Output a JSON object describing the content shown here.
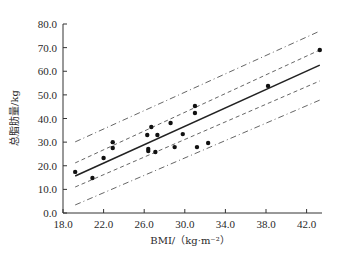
{
  "chart_data": {
    "type": "scatter",
    "title": "",
    "xlabel": "BMI/（kg·m⁻²）",
    "ylabel": "总脂肪量/kg",
    "xlim": [
      18.0,
      44.0
    ],
    "ylim": [
      0.0,
      80.0
    ],
    "x_ticks": [
      "18.0",
      "22.0",
      "26.0",
      "30.0",
      "34.0",
      "38.0",
      "42.0"
    ],
    "y_ticks": [
      "0.0",
      "10.0",
      "20.0",
      "30.0",
      "40.0",
      "50.0",
      "60.0",
      "70.0",
      "80.0"
    ],
    "grid": false,
    "legend": null,
    "points": [
      {
        "x": 19.2,
        "y": 17.4
      },
      {
        "x": 20.9,
        "y": 14.8
      },
      {
        "x": 22.0,
        "y": 23.3
      },
      {
        "x": 22.9,
        "y": 30.0
      },
      {
        "x": 22.9,
        "y": 27.5
      },
      {
        "x": 26.3,
        "y": 33.0
      },
      {
        "x": 26.7,
        "y": 36.4
      },
      {
        "x": 26.4,
        "y": 27.1
      },
      {
        "x": 26.4,
        "y": 26.2
      },
      {
        "x": 27.1,
        "y": 25.8
      },
      {
        "x": 27.3,
        "y": 33.0
      },
      {
        "x": 28.6,
        "y": 38.1
      },
      {
        "x": 29.0,
        "y": 27.9
      },
      {
        "x": 29.8,
        "y": 33.4
      },
      {
        "x": 31.0,
        "y": 45.3
      },
      {
        "x": 31.0,
        "y": 42.3
      },
      {
        "x": 31.2,
        "y": 27.9
      },
      {
        "x": 32.3,
        "y": 29.6
      },
      {
        "x": 38.2,
        "y": 53.8
      },
      {
        "x": 43.3,
        "y": 69.0
      }
    ],
    "lines": [
      {
        "name": "regression",
        "style": "solid",
        "x": [
          19.2,
          43.3
        ],
        "y": [
          15.7,
          62.6
        ]
      },
      {
        "name": "confidence-upper",
        "style": "dashed",
        "x": [
          19.2,
          43.3
        ],
        "y": [
          21.2,
          69.0
        ]
      },
      {
        "name": "confidence-lower",
        "style": "dashed",
        "x": [
          19.2,
          43.3
        ],
        "y": [
          11.0,
          55.9
        ]
      },
      {
        "name": "prediction-upper",
        "style": "dash-dot",
        "x": [
          19.2,
          43.3
        ],
        "y": [
          30.1,
          77.0
        ]
      },
      {
        "name": "prediction-lower",
        "style": "dash-dot",
        "x": [
          19.2,
          43.3
        ],
        "y": [
          3.4,
          47.8
        ]
      }
    ]
  }
}
